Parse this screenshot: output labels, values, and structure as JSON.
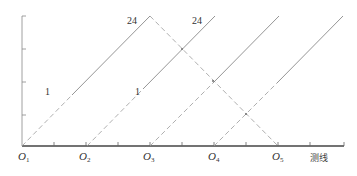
{
  "diagram": {
    "axis": {
      "x_label": "测线",
      "origin_labels": [
        {
          "base": "O",
          "sub": "1"
        },
        {
          "base": "O",
          "sub": "2"
        },
        {
          "base": "O",
          "sub": "3"
        },
        {
          "base": "O",
          "sub": "4"
        },
        {
          "base": "O",
          "sub": "5"
        }
      ]
    },
    "line_labels": [
      {
        "text": "24",
        "id": "label-24-a"
      },
      {
        "text": "24",
        "id": "label-24-b"
      },
      {
        "text": "1",
        "id": "label-1-a"
      },
      {
        "text": "1",
        "id": "label-1-b"
      }
    ],
    "colors": {
      "axis": "#555555",
      "solid_line": "#7a7a7a",
      "dashed_line": "#9a9a9a",
      "text": "#333333"
    }
  }
}
